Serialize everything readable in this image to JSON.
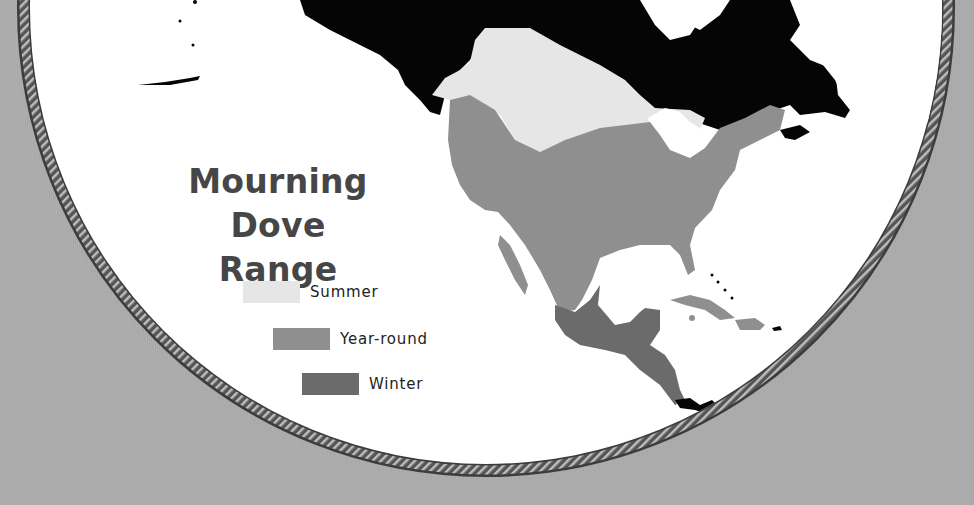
{
  "title": {
    "line1": "Mourning Dove",
    "line2": "Range"
  },
  "legend": [
    {
      "label": "Summer",
      "color": "#e6e6e6"
    },
    {
      "label": "Year-round",
      "color": "#8f8f8f"
    },
    {
      "label": "Winter",
      "color": "#6b6b6b"
    }
  ],
  "colors": {
    "background": "#ababab",
    "land": "#050505",
    "water": "#ffffff",
    "border": "#4a4a4a",
    "title": "#464646"
  }
}
